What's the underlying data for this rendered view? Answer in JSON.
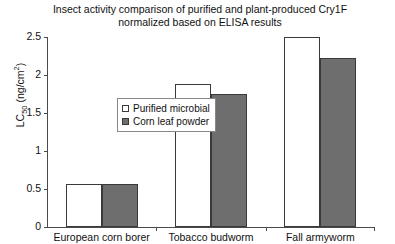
{
  "chart_data": {
    "type": "bar",
    "title": "Insect activity comparison of purified and plant-produced Cry1F\nnormalized based on ELISA results",
    "title_line1": "Insect activity comparison of purified and plant-produced Cry1F",
    "title_line2": "normalized based on ELISA results",
    "xlabel": "",
    "ylabel": "LC50 (ng/cm2)",
    "ylabel_main": "LC",
    "ylabel_sub": "50",
    "ylabel_unit_pre": " (ng/cm",
    "ylabel_unit_sup": "2",
    "ylabel_unit_post": ")",
    "categories": [
      "European corn borer",
      "Tobacco budworm",
      "Fall armyworm"
    ],
    "series": [
      {
        "name": "Purified microbial",
        "color": "#ffffff",
        "values": [
          0.57,
          1.88,
          2.5
        ]
      },
      {
        "name": "Corn leaf powder",
        "color": "#6e6e6e",
        "values": [
          0.57,
          1.75,
          2.22
        ]
      }
    ],
    "ylim": [
      0,
      2.5
    ],
    "yticks": [
      "0",
      "0.5",
      "1",
      "1.5",
      "2",
      "2.5"
    ],
    "ytick_values": [
      0,
      0.5,
      1,
      1.5,
      2,
      2.5
    ],
    "grid": false,
    "legend_position": "upper-left-inside",
    "axis_color": "#4a4a4a",
    "bar_border_color": "#3a3a3a"
  }
}
